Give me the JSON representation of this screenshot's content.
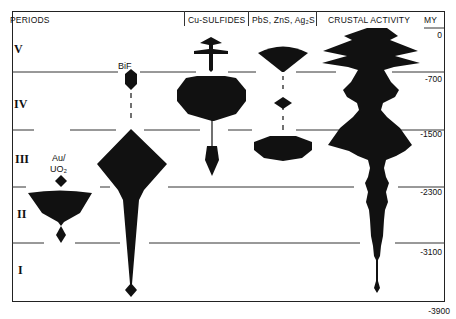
{
  "header": {
    "periods": "PERIODS",
    "columns": [
      "Cu-SULFIDES",
      "PbS, ZnS, Ag₂S",
      "CRUSTAL ACTIVITY"
    ],
    "my_label": "MY"
  },
  "periods": [
    "V",
    "IV",
    "III",
    "II",
    "I"
  ],
  "time_axis": [
    "0",
    "-700",
    "-1500",
    "-2300",
    "-3100",
    "-3900"
  ],
  "shape_labels": {
    "bif": "BiF",
    "au_line1": "Au/",
    "au_line2": "UO₂"
  },
  "colors": {
    "ink": "#111111",
    "line": "#333333",
    "background": "#ffffff"
  }
}
